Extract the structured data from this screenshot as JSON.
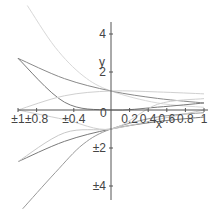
{
  "chart_data": {
    "type": "line",
    "title": "",
    "xlabel": "x",
    "ylabel": "y",
    "xlim": [
      -1,
      1
    ],
    "ylim": [
      -5,
      5
    ],
    "grid": false,
    "legend": null,
    "x_tick_labels": [
      "±1",
      "±0.8",
      "±0.4",
      "0",
      "0.2",
      "0.4",
      "0.6",
      "0.8",
      "1"
    ],
    "y_tick_labels": [
      "4",
      "2",
      "±2",
      "±4"
    ],
    "series": [
      {
        "name": "exp(-2x) (light)",
        "color": "#d8d8d8",
        "x": [
          -0.9,
          -0.6,
          -0.3,
          0,
          0.5,
          1
        ],
        "values": [
          5.5,
          3.3,
          1.8,
          1.0,
          0.37,
          0.14
        ]
      },
      {
        "name": "exp(-x)",
        "color": "#8a8a8a",
        "x": [
          -1,
          -0.5,
          0,
          0.5,
          1
        ],
        "values": [
          2.72,
          1.65,
          1.0,
          0.61,
          0.37
        ]
      },
      {
        "name": "x^2 exp(-x)",
        "color": "#7a7a7a",
        "x": [
          -1,
          -0.5,
          0,
          0.5,
          1
        ],
        "values": [
          2.72,
          0.41,
          0.0,
          0.15,
          0.37
        ]
      },
      {
        "name": "rising light",
        "color": "#d0d0d0",
        "x": [
          -1,
          -0.5,
          0,
          0.5,
          1
        ],
        "values": [
          0.0,
          0.75,
          1.0,
          0.95,
          0.85
        ]
      },
      {
        "name": "-exp(-x)",
        "color": "#7a7a7a",
        "x": [
          -1,
          -0.5,
          0,
          0.5,
          1
        ],
        "values": [
          -2.72,
          -1.65,
          -1.0,
          -0.61,
          -0.37
        ]
      },
      {
        "name": "-exp(-2x)",
        "color": "#9a9a9a",
        "x": [
          -0.95,
          -0.6,
          -0.3,
          0,
          0.5,
          1
        ],
        "values": [
          -5.2,
          -3.3,
          -1.8,
          -1.0,
          -0.37,
          -0.14
        ]
      },
      {
        "name": "lower light",
        "color": "#c8c8c8",
        "x": [
          -1,
          -0.5,
          0,
          0.5,
          1
        ],
        "values": [
          -2.72,
          -1.2,
          -1.0,
          -0.5,
          0.0
        ]
      },
      {
        "name": "upper light negative",
        "color": "#cfcfcf",
        "x": [
          -1,
          -0.5,
          0,
          0.5,
          1
        ],
        "values": [
          0.0,
          -0.5,
          -1.0,
          0.3,
          0.6
        ]
      }
    ]
  },
  "axes": {
    "x_label": "x",
    "y_label": "y",
    "x_ticks": [
      {
        "label": "±1",
        "x": -1
      },
      {
        "label": "±0.8",
        "x": -0.8
      },
      {
        "label": "±0.4",
        "x": -0.4
      },
      {
        "label": "0.2",
        "x": 0.2
      },
      {
        "label": "0.4",
        "x": 0.4
      },
      {
        "label": "0.6",
        "x": 0.6
      },
      {
        "label": "0.8",
        "x": 0.8
      },
      {
        "label": "1",
        "x": 1
      }
    ],
    "origin_label": "0",
    "y_ticks": [
      {
        "label": "4",
        "y": 4
      },
      {
        "label": "2",
        "y": 2
      },
      {
        "label": "±2",
        "y": -2
      },
      {
        "label": "±4",
        "y": -4
      }
    ]
  }
}
